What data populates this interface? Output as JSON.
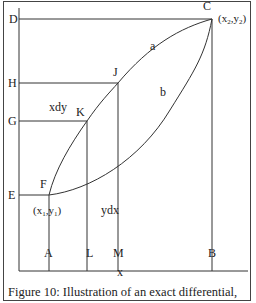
{
  "figure": {
    "caption": "Figure 10: Illustration of an exact differential,",
    "axis_x_label": "x",
    "points": {
      "C": "C",
      "D": "D",
      "H": "H",
      "G": "G",
      "E": "E",
      "J": "J",
      "K": "K",
      "F": "F",
      "A": "A",
      "L": "L",
      "M": "M",
      "B": "B"
    },
    "curves": {
      "a": "a",
      "b": "b"
    },
    "coords": {
      "start": "(x1,y1)",
      "end": "(x2,y2)"
    },
    "areas": {
      "upper": "xdy",
      "lower": "ydx"
    },
    "line_color": "#333333"
  }
}
